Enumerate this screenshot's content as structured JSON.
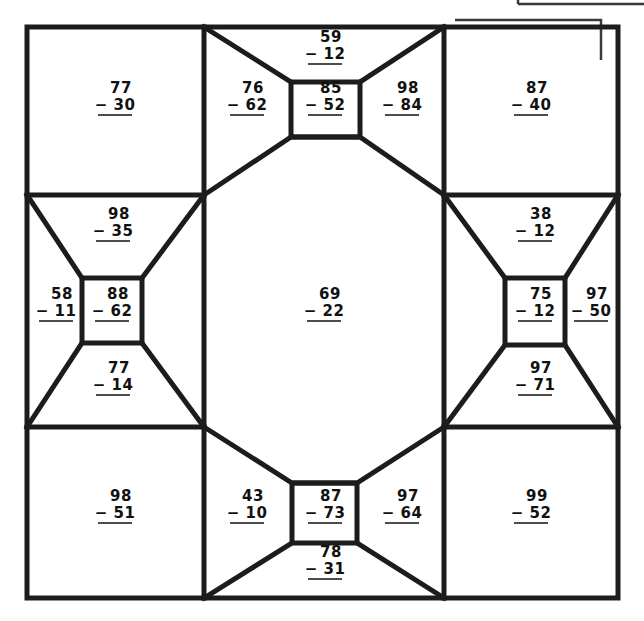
{
  "document": {
    "kind": "math-worksheet",
    "topic": "two-digit subtraction",
    "problem_count": 21,
    "operator": "−",
    "ink_color": "#111111",
    "line_color": "#1c1c1c",
    "background_color": "#ffffff"
  },
  "partial_box": {
    "present": true,
    "label": "",
    "description_visible_text": ""
  },
  "problems": [
    {
      "id": "corner-top-left",
      "region": "corner",
      "minuend": "77",
      "subtrahend": "30",
      "op": "−",
      "x": 115,
      "y": 99
    },
    {
      "id": "trap-top-left",
      "region": "trapezoid",
      "minuend": "76",
      "subtrahend": "62",
      "op": "−",
      "x": 247,
      "y": 99
    },
    {
      "id": "square-top",
      "region": "square",
      "minuend": "85",
      "subtrahend": "52",
      "op": "−",
      "x": 325,
      "y": 99
    },
    {
      "id": "wedge-top",
      "region": "wedge",
      "minuend": "59",
      "subtrahend": "12",
      "op": "−",
      "x": 325,
      "y": 48
    },
    {
      "id": "trap-top-right",
      "region": "trapezoid",
      "minuend": "98",
      "subtrahend": "84",
      "op": "−",
      "x": 402,
      "y": 99
    },
    {
      "id": "corner-top-right",
      "region": "corner",
      "minuend": "87",
      "subtrahend": "40",
      "op": "−",
      "x": 531,
      "y": 99
    },
    {
      "id": "trap-left-upper",
      "region": "trapezoid",
      "minuend": "98",
      "subtrahend": "35",
      "op": "−",
      "x": 113,
      "y": 225
    },
    {
      "id": "wedge-left",
      "region": "wedge",
      "minuend": "58",
      "subtrahend": "11",
      "op": "−",
      "x": 56,
      "y": 305
    },
    {
      "id": "square-left",
      "region": "square",
      "minuend": "88",
      "subtrahend": "62",
      "op": "−",
      "x": 112,
      "y": 305
    },
    {
      "id": "center-octagon",
      "region": "center",
      "minuend": "69",
      "subtrahend": "22",
      "op": "−",
      "x": 324,
      "y": 305
    },
    {
      "id": "square-right",
      "region": "square",
      "minuend": "75",
      "subtrahend": "12",
      "op": "−",
      "x": 535,
      "y": 305
    },
    {
      "id": "wedge-right",
      "region": "wedge",
      "minuend": "97",
      "subtrahend": "50",
      "op": "−",
      "x": 591,
      "y": 305
    },
    {
      "id": "trap-right-upper",
      "region": "trapezoid",
      "minuend": "38",
      "subtrahend": "12",
      "op": "−",
      "x": 535,
      "y": 225
    },
    {
      "id": "trap-left-lower",
      "region": "trapezoid",
      "minuend": "77",
      "subtrahend": "14",
      "op": "−",
      "x": 113,
      "y": 379
    },
    {
      "id": "trap-right-lower",
      "region": "trapezoid",
      "minuend": "97",
      "subtrahend": "71",
      "op": "−",
      "x": 535,
      "y": 379
    },
    {
      "id": "corner-bottom-left",
      "region": "corner",
      "minuend": "98",
      "subtrahend": "51",
      "op": "−",
      "x": 115,
      "y": 507
    },
    {
      "id": "trap-bottom-left",
      "region": "trapezoid",
      "minuend": "43",
      "subtrahend": "10",
      "op": "−",
      "x": 247,
      "y": 507
    },
    {
      "id": "square-bottom",
      "region": "square",
      "minuend": "87",
      "subtrahend": "73",
      "op": "−",
      "x": 325,
      "y": 507
    },
    {
      "id": "wedge-bottom",
      "region": "wedge",
      "minuend": "78",
      "subtrahend": "31",
      "op": "−",
      "x": 325,
      "y": 563
    },
    {
      "id": "trap-bottom-right",
      "region": "trapezoid",
      "minuend": "97",
      "subtrahend": "64",
      "op": "−",
      "x": 402,
      "y": 507
    },
    {
      "id": "corner-bottom-right",
      "region": "corner",
      "minuend": "99",
      "subtrahend": "52",
      "op": "−",
      "x": 531,
      "y": 507
    }
  ]
}
